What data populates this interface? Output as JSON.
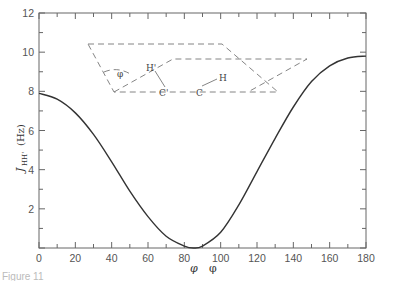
{
  "chart_data": {
    "type": "line",
    "title": "",
    "xlabel": "φ",
    "ylabel": "J_HH' (Hz)",
    "xlim": [
      0,
      180
    ],
    "ylim": [
      0,
      12
    ],
    "x_ticks": [
      "0",
      "20",
      "40",
      "60",
      "80",
      "100",
      "120",
      "140",
      "160",
      "180"
    ],
    "y_ticks": [
      "2",
      "4",
      "6",
      "8",
      "10",
      "12"
    ],
    "grid": false,
    "series": [
      {
        "name": "J_HH' vs dihedral angle",
        "x": [
          0,
          10,
          20,
          30,
          40,
          50,
          60,
          70,
          80,
          85,
          90,
          100,
          110,
          120,
          130,
          140,
          150,
          160,
          170,
          180
        ],
        "y": [
          7.9,
          7.6,
          6.9,
          5.8,
          4.4,
          2.9,
          1.6,
          0.6,
          0.1,
          0.0,
          0.1,
          0.8,
          2.2,
          3.9,
          5.6,
          7.2,
          8.5,
          9.3,
          9.7,
          9.8
        ]
      }
    ],
    "inset_diagram": {
      "description": "Dihedral angle between H'-C'-C and C'-C-H planes",
      "labels": [
        "φ",
        "H'",
        "C'",
        "C",
        "H"
      ]
    }
  },
  "axes": {
    "xlabel_main": "φ",
    "xlabel_extra": "φ",
    "ylabel_J": "J",
    "ylabel_sub": "HH'",
    "ylabel_unit": "(Hz)"
  },
  "inset": {
    "phi": "φ",
    "h_prime": "H'",
    "c_prime": "C'",
    "c": "C",
    "h": "H"
  },
  "caption": "Figure 11"
}
